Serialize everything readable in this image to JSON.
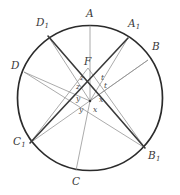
{
  "figure": {
    "type": "geometry-diagram",
    "background_color": "#ffffff",
    "circle_stroke_color": "#2b2b2b",
    "thick_chord_color": "#3a3a3a",
    "thin_chord_color": "#8a8a8a",
    "label_color": "#3a3a3a",
    "angle_label_color": "#4a4a4a",
    "circle": {
      "cx": 90,
      "cy": 98,
      "r": 72.5
    },
    "points": [
      {
        "name": "A",
        "label": "A",
        "sub": "",
        "x": 90,
        "y": 25.5,
        "label_x": 86,
        "label_y": 8
      },
      {
        "name": "A1",
        "label": "A",
        "sub": "1",
        "x": 128,
        "y": 38,
        "label_x": 128,
        "label_y": 18
      },
      {
        "name": "B",
        "label": "B",
        "sub": "",
        "x": 148,
        "y": 60,
        "label_x": 152,
        "label_y": 41
      },
      {
        "name": "B1",
        "label": "B",
        "sub": "1",
        "x": 145,
        "y": 148,
        "label_x": 148,
        "label_y": 150
      },
      {
        "name": "C",
        "label": "C",
        "sub": "",
        "x": 76,
        "y": 170.5,
        "label_x": 72,
        "label_y": 176
      },
      {
        "name": "C1",
        "label": "C",
        "sub": "1",
        "x": 30,
        "y": 143,
        "label_x": 13,
        "label_y": 136
      },
      {
        "name": "D",
        "label": "D",
        "sub": "",
        "x": 24,
        "y": 72,
        "label_x": 11,
        "label_y": 60
      },
      {
        "name": "D1",
        "label": "D",
        "sub": "1",
        "x": 48,
        "y": 36,
        "label_x": 36,
        "label_y": 17
      },
      {
        "name": "F",
        "label": "F",
        "sub": "",
        "x": 88,
        "y": 68,
        "label_x": 84,
        "label_y": 56
      }
    ],
    "center_point": {
      "x": 90,
      "y": 101
    },
    "chords_thick": [
      {
        "from": "D1",
        "to": "B1"
      },
      {
        "from": "A1",
        "to": "C1"
      },
      {
        "from": "D1",
        "to": "center"
      },
      {
        "from": "A1",
        "to": "center"
      }
    ],
    "chords_thin": [
      {
        "from": "A",
        "to": "center"
      },
      {
        "from": "C",
        "to": "center"
      },
      {
        "from": "D",
        "to": "center"
      },
      {
        "from": "B",
        "to": "center"
      },
      {
        "from": "C1",
        "to": "F"
      },
      {
        "from": "B1",
        "to": "F"
      },
      {
        "from": "C1",
        "to": "B"
      },
      {
        "from": "D",
        "to": "B1"
      },
      {
        "from": "A1",
        "to": "center"
      },
      {
        "from": "D1",
        "to": "center"
      }
    ],
    "angle_labels": [
      {
        "name": "angle-z-upper-left",
        "text": "z",
        "x": 80,
        "y": 74
      },
      {
        "name": "angle-t-upper-right",
        "text": "t",
        "x": 101,
        "y": 74
      },
      {
        "name": "angle-z-lower-left",
        "text": "z",
        "x": 76,
        "y": 83
      },
      {
        "name": "angle-t-lower-right",
        "text": "t",
        "x": 104,
        "y": 82
      },
      {
        "name": "angle-y-left",
        "text": "y",
        "x": 76,
        "y": 95
      },
      {
        "name": "angle-x-right",
        "text": "x",
        "x": 99,
        "y": 96
      },
      {
        "name": "angle-y-below-left",
        "text": "y",
        "x": 79,
        "y": 106
      },
      {
        "name": "angle-x-below-right",
        "text": "x",
        "x": 93,
        "y": 106
      }
    ]
  }
}
